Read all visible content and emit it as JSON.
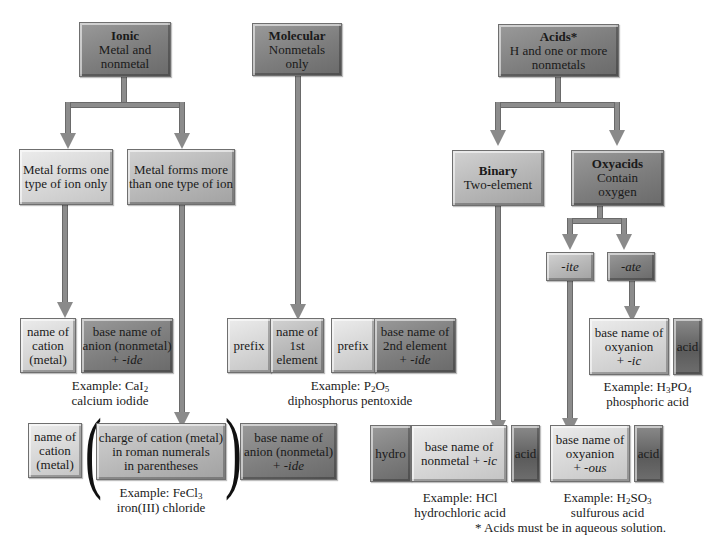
{
  "diagram": {
    "top_nodes": {
      "ionic": {
        "title": "Ionic",
        "line1": "Metal and",
        "line2": "nonmetal"
      },
      "molecular": {
        "title": "Molecular",
        "line1": "Nonmetals",
        "line2": "only"
      },
      "acids": {
        "title": "Acids*",
        "line1": "H and one or more",
        "line2": "nonmetals"
      }
    },
    "ionic_branches": {
      "one_ion": {
        "line1": "Metal forms one",
        "line2": "type of ion only"
      },
      "more_ion": {
        "line1": "Metal forms more",
        "line2": "than one type of ion"
      }
    },
    "ionic_one_formula": {
      "cation": {
        "line1": "name of",
        "line2": "cation",
        "line3": "(metal)"
      },
      "anion": {
        "line1": "base name of",
        "line2": "anion (nonmetal)",
        "line3_prefix": "+ ",
        "line3_suffix": "-ide"
      },
      "example_label": "Example: ",
      "example_formula": {
        "a": "CaI",
        "sub1": "2"
      },
      "example_name": "calcium iodide"
    },
    "ionic_more_formula": {
      "cation": {
        "line1": "name of",
        "line2": "cation",
        "line3": "(metal)"
      },
      "paren_open": "(",
      "charge": {
        "line1": "charge of cation (metal)",
        "line2": "in roman numerals",
        "line3": "in parentheses"
      },
      "paren_close": ")",
      "anion": {
        "line1": "base name of",
        "line2": "anion (nonmetal)",
        "line3_prefix": "+ ",
        "line3_suffix": "-ide"
      },
      "example_label": "Example: ",
      "example_formula": {
        "a": "FeCl",
        "sub1": "3"
      },
      "example_name": "iron(III) chloride"
    },
    "molecular_formula": {
      "prefix1": "prefix",
      "first": {
        "line1": "name of",
        "line2": "1st",
        "line3": "element"
      },
      "prefix2": "prefix",
      "second": {
        "line1": "base name of",
        "line2": "2nd element",
        "line3_prefix": "+ ",
        "line3_suffix": "-ide"
      },
      "example_label": "Example: ",
      "example_formula": {
        "a": "P",
        "sub1": "2",
        "b": "O",
        "sub2": "5"
      },
      "example_name": "diphosphorus pentoxide"
    },
    "acid_branches": {
      "binary": {
        "title": "Binary",
        "line1": "Two-element"
      },
      "oxyacids": {
        "title": "Oxyacids",
        "line1": "Contain",
        "line2": "oxygen"
      }
    },
    "oxy_suffixes": {
      "ite": "-ite",
      "ate": "-ate"
    },
    "ate_formula": {
      "base": {
        "line1": "base name of",
        "line2": "oxyanion",
        "line3_prefix": "+ ",
        "line3_suffix": "-ic"
      },
      "acid": "acid",
      "example_label": "Example: ",
      "example_formula": {
        "a": "H",
        "sub1": "3",
        "b": "PO",
        "sub2": "4"
      },
      "example_name": "phosphoric acid"
    },
    "binary_formula": {
      "hydro": "hydro",
      "base": {
        "line1": "base name of",
        "line2_prefix": "nonmetal + ",
        "line2_suffix": "-ic"
      },
      "acid": "acid",
      "example_label": "Example: HCl",
      "example_name": "hydrochloric acid"
    },
    "ite_formula": {
      "base": {
        "line1": "base name of",
        "line2": "oxyanion",
        "line3_prefix": "+ ",
        "line3_suffix": "-ous"
      },
      "acid": "acid",
      "example_label": "Example: ",
      "example_formula": {
        "a": "H",
        "sub1": "2",
        "b": "SO",
        "sub2": "3"
      },
      "example_name": "sulfurous acid"
    },
    "footnote": "* Acids must be in aqueous solution."
  }
}
